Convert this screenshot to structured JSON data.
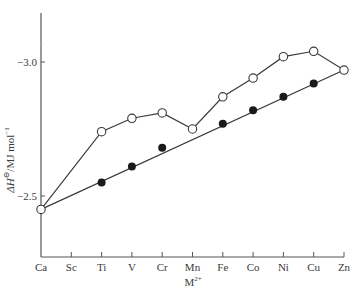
{
  "chart_data": {
    "type": "line",
    "title": "",
    "xlabel": "M2+",
    "xlabel_main": "M",
    "xlabel_sup": "2+",
    "ylabel": "ΔH⊖/MJ mol⁻¹",
    "ylabel_main": "ΔH",
    "ylabel_rest": "⊖/MJ mol",
    "ylabel_sup": "−1",
    "categories": [
      "Ca",
      "Sc",
      "Ti",
      "V",
      "Cr",
      "Mn",
      "Fe",
      "Co",
      "Ni",
      "Cu",
      "Zn"
    ],
    "yticks": [
      {
        "value": -2.5,
        "label": "−2.5"
      },
      {
        "value": -3.0,
        "label": "−3.0"
      }
    ],
    "ylim": [
      -2.3,
      -3.18
    ],
    "y_direction": "more negative upward",
    "grid": false,
    "legend": null,
    "series": [
      {
        "name": "observed (open circles)",
        "marker": "open-circle",
        "connected": true,
        "values": [
          -2.45,
          null,
          -2.74,
          -2.79,
          -2.81,
          -2.75,
          -2.87,
          -2.94,
          -3.02,
          -3.04,
          -2.97
        ]
      },
      {
        "name": "corrected (filled circles)",
        "marker": "filled-circle",
        "connected": false,
        "values": [
          null,
          null,
          -2.55,
          -2.61,
          -2.68,
          null,
          -2.77,
          -2.82,
          -2.87,
          -2.92,
          null
        ]
      },
      {
        "name": "baseline Ca–Mn–Zn",
        "marker": "none",
        "connected": true,
        "line_from": {
          "category": "Ca",
          "value": -2.45
        },
        "line_to": {
          "category": "Zn",
          "value": -2.97
        }
      }
    ]
  },
  "colors": {
    "axis": "#555555",
    "line": "#3a3a3a",
    "marker_fill": "#1a1a1a",
    "background": "#ffffff"
  }
}
